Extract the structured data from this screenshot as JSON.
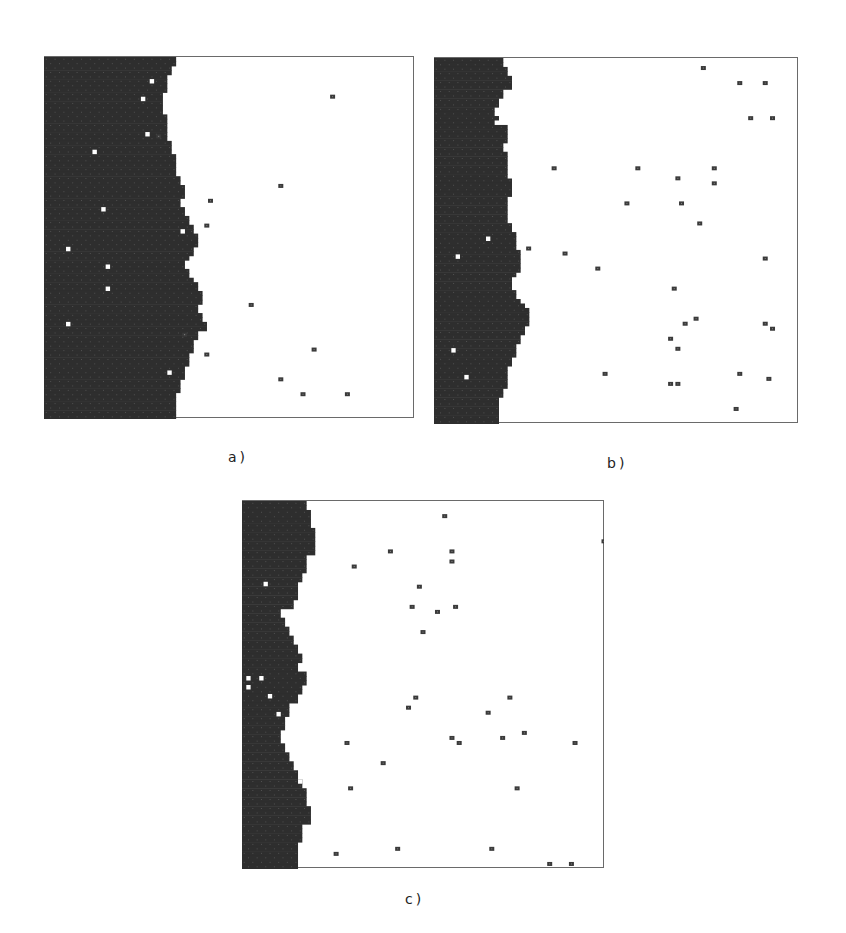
{
  "figure": {
    "background": "#ffffff",
    "dark_color": "#2e2e2e",
    "particle_color": "#3a3a3a",
    "hole_color": "#ffffff",
    "grid_cells": 82,
    "panels": [
      {
        "id": "a",
        "label": "a)",
        "box": {
          "x": 44,
          "y": 56,
          "w": 370,
          "h": 362
        },
        "label_pos": {
          "x": 228,
          "y": 449
        },
        "front_profile": [
          30,
          30,
          29,
          29,
          28,
          28,
          28,
          28,
          27,
          27,
          27,
          27,
          27,
          28,
          28,
          28,
          28,
          28,
          28,
          29,
          29,
          29,
          30,
          30,
          30,
          30,
          30,
          31,
          31,
          32,
          32,
          32,
          31,
          31,
          32,
          32,
          33,
          33,
          34,
          34,
          35,
          35,
          35,
          34,
          34,
          33,
          32,
          32,
          33,
          33,
          34,
          35,
          35,
          36,
          36,
          36,
          35,
          35,
          36,
          36,
          37,
          37,
          35,
          35,
          34,
          34,
          34,
          33,
          33,
          33,
          32,
          32,
          32,
          31,
          31,
          31,
          30,
          30,
          30,
          30,
          30,
          30
        ],
        "holes": [
          [
            24,
            5
          ],
          [
            22,
            9
          ],
          [
            23,
            17
          ],
          [
            11,
            21
          ],
          [
            13,
            34
          ],
          [
            31,
            39
          ],
          [
            5,
            43
          ],
          [
            14,
            47
          ],
          [
            14,
            52
          ],
          [
            5,
            60
          ],
          [
            28,
            71
          ]
        ],
        "particles": [
          [
            78,
            8
          ],
          [
            31,
            16
          ],
          [
            64,
            26
          ],
          [
            45,
            29
          ],
          [
            44,
            34
          ],
          [
            56,
            50
          ],
          [
            38,
            56
          ],
          [
            73,
            59
          ],
          [
            44,
            60
          ],
          [
            64,
            65
          ],
          [
            70,
            68
          ],
          [
            82,
            68
          ]
        ]
      },
      {
        "id": "b",
        "label": "b)",
        "box": {
          "x": 434,
          "y": 57,
          "w": 364,
          "h": 366
        },
        "label_pos": {
          "x": 607,
          "y": 455
        },
        "front_profile": [
          16,
          16,
          17,
          17,
          18,
          18,
          18,
          16,
          16,
          15,
          15,
          14,
          14,
          15,
          15,
          17,
          17,
          17,
          17,
          16,
          16,
          17,
          17,
          17,
          17,
          17,
          17,
          18,
          18,
          18,
          18,
          17,
          17,
          17,
          17,
          17,
          17,
          18,
          18,
          19,
          19,
          19,
          19,
          20,
          20,
          20,
          20,
          20,
          19,
          18,
          18,
          18,
          19,
          19,
          20,
          21,
          22,
          22,
          22,
          22,
          21,
          21,
          20,
          20,
          19,
          19,
          19,
          18,
          18,
          17,
          17,
          17,
          17,
          17,
          16,
          16,
          15,
          15,
          15,
          15,
          15,
          15
        ],
        "holes": [
          [
            14,
            14
          ],
          [
            12,
            40
          ],
          [
            5,
            44
          ],
          [
            4,
            65
          ],
          [
            7,
            71
          ]
        ],
        "particles": [
          [
            74,
            2
          ],
          [
            84,
            5
          ],
          [
            91,
            5
          ],
          [
            87,
            12
          ],
          [
            93,
            12
          ],
          [
            33,
            22
          ],
          [
            56,
            22
          ],
          [
            67,
            24
          ],
          [
            77,
            22
          ],
          [
            77,
            25
          ],
          [
            53,
            29
          ],
          [
            68,
            29
          ],
          [
            73,
            33
          ],
          [
            26,
            38
          ],
          [
            36,
            39
          ],
          [
            91,
            40
          ],
          [
            45,
            42
          ],
          [
            66,
            46
          ],
          [
            69,
            53
          ],
          [
            72,
            52
          ],
          [
            91,
            53
          ],
          [
            93,
            54
          ],
          [
            65,
            56
          ],
          [
            67,
            58
          ],
          [
            47,
            63
          ],
          [
            84,
            63
          ],
          [
            92,
            64
          ],
          [
            65,
            65
          ],
          [
            67,
            65
          ],
          [
            83,
            70
          ]
        ]
      },
      {
        "id": "c",
        "label": "c)",
        "box": {
          "x": 242,
          "y": 500,
          "w": 362,
          "h": 368
        },
        "label_pos": {
          "x": 405,
          "y": 891
        },
        "front_profile": [
          15,
          15,
          16,
          16,
          16,
          16,
          17,
          17,
          17,
          17,
          17,
          17,
          15,
          15,
          15,
          15,
          14,
          14,
          13,
          13,
          13,
          13,
          12,
          12,
          9,
          9,
          10,
          10,
          11,
          11,
          12,
          12,
          13,
          13,
          14,
          14,
          13,
          13,
          15,
          15,
          15,
          14,
          14,
          13,
          13,
          11,
          11,
          11,
          10,
          10,
          10,
          9,
          9,
          9,
          10,
          10,
          11,
          11,
          12,
          12,
          13,
          13,
          14,
          14,
          15,
          15,
          15,
          15,
          16,
          16,
          16,
          16,
          14,
          14,
          14,
          14,
          13,
          13,
          13,
          13,
          13,
          13
        ],
        "holes": [
          [
            5,
            18
          ],
          [
            1,
            39
          ],
          [
            4,
            39
          ],
          [
            1,
            41
          ],
          [
            6,
            43
          ],
          [
            8,
            47
          ],
          [
            13,
            62
          ]
        ],
        "particles": [
          [
            56,
            3
          ],
          [
            100,
            8
          ],
          [
            41,
            10
          ],
          [
            58,
            10
          ],
          [
            58,
            12
          ],
          [
            31,
            13
          ],
          [
            49,
            17
          ],
          [
            47,
            21
          ],
          [
            59,
            21
          ],
          [
            54,
            22
          ],
          [
            50,
            26
          ],
          [
            48,
            39
          ],
          [
            74,
            39
          ],
          [
            46,
            41
          ],
          [
            68,
            42
          ],
          [
            58,
            47
          ],
          [
            60,
            48
          ],
          [
            72,
            47
          ],
          [
            78,
            46
          ],
          [
            29,
            48
          ],
          [
            92,
            48
          ],
          [
            39,
            52
          ],
          [
            30,
            57
          ],
          [
            76,
            57
          ],
          [
            43,
            69
          ],
          [
            69,
            69
          ],
          [
            26,
            70
          ],
          [
            85,
            72
          ],
          [
            91,
            72
          ]
        ]
      }
    ]
  }
}
